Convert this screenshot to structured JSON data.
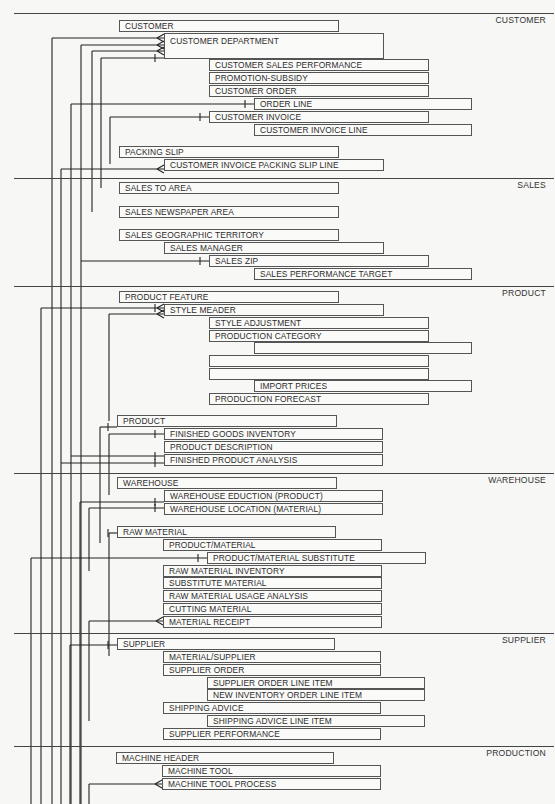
{
  "sections": [
    {
      "name": "CUSTOMER",
      "y": 13
    },
    {
      "name": "SALES",
      "y": 178
    },
    {
      "name": "PRODUCT",
      "y": 286
    },
    {
      "name": "WAREHOUSE",
      "y": 473
    },
    {
      "name": "SUPPLIER",
      "y": 633
    },
    {
      "name": "PRODUCTION",
      "y": 746
    }
  ],
  "entities": [
    {
      "label": "CUSTOMER",
      "x": 119,
      "y": 20,
      "w": 220
    },
    {
      "label": "CUSTOMER DEPARTMENT",
      "x": 164,
      "y": 33,
      "w": 220,
      "tall": true
    },
    {
      "label": "CUSTOMER SALES PERFORMANCE",
      "x": 209,
      "y": 59,
      "w": 220
    },
    {
      "label": "PROMOTION-SUBSIDY",
      "x": 209,
      "y": 72,
      "w": 220
    },
    {
      "label": "CUSTOMER ORDER",
      "x": 209,
      "y": 85,
      "w": 220
    },
    {
      "label": "ORDER LINE",
      "x": 254,
      "y": 98,
      "w": 218
    },
    {
      "label": "CUSTOMER INVOICE",
      "x": 209,
      "y": 111,
      "w": 220
    },
    {
      "label": "CUSTOMER INVOICE LINE",
      "x": 254,
      "y": 124,
      "w": 218
    },
    {
      "label": "PACKING SLIP",
      "x": 119,
      "y": 146,
      "w": 220
    },
    {
      "label": "CUSTOMER INVOICE PACKING SLIP LINE",
      "x": 164,
      "y": 159,
      "w": 220
    },
    {
      "label": "SALES TO AREA",
      "x": 119,
      "y": 182,
      "w": 220
    },
    {
      "label": "SALES NEWSPAPER AREA",
      "x": 119,
      "y": 206,
      "w": 220
    },
    {
      "label": "SALES GEOGRAPHIC TERRITORY",
      "x": 119,
      "y": 229,
      "w": 220
    },
    {
      "label": "SALES MANAGER",
      "x": 164,
      "y": 242,
      "w": 220
    },
    {
      "label": "SALES ZIP",
      "x": 209,
      "y": 255,
      "w": 220
    },
    {
      "label": "SALES PERFORMANCE TARGET",
      "x": 254,
      "y": 268,
      "w": 218
    },
    {
      "label": "PRODUCT FEATURE",
      "x": 119,
      "y": 291,
      "w": 220
    },
    {
      "label": "STYLE MEADER",
      "x": 164,
      "y": 304,
      "w": 220
    },
    {
      "label": "STYLE ADJUSTMENT",
      "x": 209,
      "y": 317,
      "w": 220
    },
    {
      "label": "PRODUCTION CATEGORY",
      "x": 209,
      "y": 330,
      "w": 220
    },
    {
      "label": "",
      "x": 254,
      "y": 342,
      "w": 218
    },
    {
      "label": "",
      "x": 209,
      "y": 355,
      "w": 220
    },
    {
      "label": "",
      "x": 209,
      "y": 368,
      "w": 220
    },
    {
      "label": "IMPORT PRICES",
      "x": 254,
      "y": 380,
      "w": 218
    },
    {
      "label": "PRODUCTION FORECAST",
      "x": 209,
      "y": 393,
      "w": 220
    },
    {
      "label": "PRODUCT",
      "x": 117,
      "y": 415,
      "w": 220
    },
    {
      "label": "FINISHED GOODS INVENTORY",
      "x": 164,
      "y": 428,
      "w": 219
    },
    {
      "label": "PRODUCT DESCRIPTION",
      "x": 164,
      "y": 441,
      "w": 219
    },
    {
      "label": "FINISHED PRODUCT ANALYSIS",
      "x": 164,
      "y": 454,
      "w": 219
    },
    {
      "label": "WAREHOUSE",
      "x": 117,
      "y": 477,
      "w": 220
    },
    {
      "label": "WAREHOUSE EDUCTION (PRODUCT)",
      "x": 164,
      "y": 490,
      "w": 219
    },
    {
      "label": "WAREHOUSE LOCATION (MATERIAL)",
      "x": 164,
      "y": 503,
      "w": 219
    },
    {
      "label": "RAW MATERIAL",
      "x": 117,
      "y": 526,
      "w": 219
    },
    {
      "label": "PRODUCT/MATERIAL",
      "x": 163,
      "y": 539,
      "w": 219
    },
    {
      "label": "PRODUCT/MATERIAL SUBSTITUTE",
      "x": 207,
      "y": 552,
      "w": 219
    },
    {
      "label": "RAW MATERIAL INVENTORY",
      "x": 163,
      "y": 565,
      "w": 219
    },
    {
      "label": "SUBSTITUTE MATERIAL",
      "x": 163,
      "y": 577,
      "w": 219
    },
    {
      "label": "RAW MATERIAL USAGE ANALYSIS",
      "x": 163,
      "y": 590,
      "w": 219
    },
    {
      "label": "CUTTING MATERIAL",
      "x": 163,
      "y": 603,
      "w": 219
    },
    {
      "label": "MATERIAL RECEIPT",
      "x": 163,
      "y": 616,
      "w": 219
    },
    {
      "label": "SUPPLIER",
      "x": 117,
      "y": 638,
      "w": 218
    },
    {
      "label": "MATERIAL/SUPPLIER",
      "x": 163,
      "y": 651,
      "w": 218
    },
    {
      "label": "SUPPLIER ORDER",
      "x": 163,
      "y": 664,
      "w": 218
    },
    {
      "label": "SUPPLIER ORDER LINE ITEM",
      "x": 207,
      "y": 677,
      "w": 218
    },
    {
      "label": "NEW INVENTORY ORDER LINE ITEM",
      "x": 207,
      "y": 689,
      "w": 218
    },
    {
      "label": "SHIPPING ADVICE",
      "x": 163,
      "y": 702,
      "w": 218
    },
    {
      "label": "SHIPPING ADVICE LINE ITEM",
      "x": 207,
      "y": 715,
      "w": 218
    },
    {
      "label": "SUPPLIER PERFORMANCE",
      "x": 163,
      "y": 728,
      "w": 218
    },
    {
      "label": "MACHINE HEADER",
      "x": 116,
      "y": 752,
      "w": 218
    },
    {
      "label": "MACHINE TOOL",
      "x": 162,
      "y": 765,
      "w": 219
    },
    {
      "label": "MACHINE TOOL PROCESS",
      "x": 162,
      "y": 778,
      "w": 219
    }
  ],
  "connectors": [
    {
      "from_x": 52,
      "y": 38,
      "to_x": 164,
      "end": "crowfoot",
      "v_to": 804
    },
    {
      "from_x": 81,
      "y": 45,
      "to_x": 164,
      "end": "crowfoot",
      "v_to": 804
    },
    {
      "from_x": 92,
      "y": 51,
      "to_x": 164,
      "end": "crowfoot",
      "v_to": 212
    },
    {
      "from_x": 101,
      "y": 58,
      "to_x": 164,
      "end": "one",
      "v_to": 188
    },
    {
      "from_x": 71,
      "y": 104,
      "to_x": 254,
      "end": "one",
      "v_to": 804
    },
    {
      "from_x": 110,
      "y": 117,
      "to_x": 209,
      "end": "one",
      "v_to": 164
    },
    {
      "from_x": 61,
      "y": 169,
      "to_x": 164,
      "end": "crowfoot",
      "v_to": 804
    },
    {
      "from_x": 81,
      "y": 261,
      "to_x": 209,
      "end": "one",
      "v_to": null
    },
    {
      "from_x": 41,
      "y": 308,
      "to_x": 164,
      "end": "one-crowfoot",
      "v_to": 804
    },
    {
      "from_x": 109,
      "y": 314,
      "to_x": 164,
      "end": "crowfoot",
      "v_to": 421
    },
    {
      "from_x": 100,
      "y": 427,
      "to_x": 117,
      "end": "one",
      "v_to": 543
    },
    {
      "from_x": 109,
      "y": 434,
      "to_x": 164,
      "end": "one",
      "v_to": 495
    },
    {
      "from_x": 71,
      "y": 456,
      "to_x": 164,
      "end": "one",
      "v_to": null
    },
    {
      "from_x": 61,
      "y": 463,
      "to_x": 164,
      "end": "one",
      "v_to": null
    },
    {
      "from_x": 80,
      "y": 502,
      "to_x": 164,
      "end": "one",
      "v_to": 804
    },
    {
      "from_x": 89,
      "y": 508,
      "to_x": 164,
      "end": "one",
      "v_to": 571
    },
    {
      "from_x": 109,
      "y": 533,
      "to_x": 117,
      "end": "one",
      "v_to": 656
    },
    {
      "from_x": 31,
      "y": 558,
      "to_x": 207,
      "end": "one",
      "v_to": 804
    },
    {
      "from_x": 89,
      "y": 621,
      "to_x": 163,
      "end": "crowfoot",
      "v_to": 721
    },
    {
      "from_x": 70,
      "y": 645,
      "to_x": 117,
      "end": "one",
      "v_to": 804
    },
    {
      "from_x": 89,
      "y": 784,
      "to_x": 162,
      "end": "crowfoot",
      "v_to": 804
    }
  ]
}
